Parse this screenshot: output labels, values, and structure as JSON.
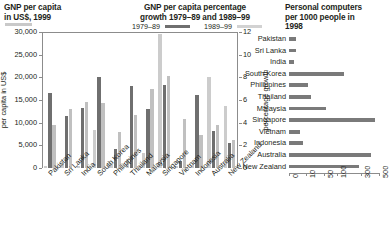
{
  "panels": {
    "left": {
      "title": "GNP per capita\nin US$, 1999",
      "title_line1": "GNP per capita",
      "title_line2": "in US$, 1999",
      "ylabel": "per capita in US$",
      "legend_swatch_color": "#c9c9c9"
    },
    "middle": {
      "title_line1": "GNP per capita percentage",
      "title_line2": "growth 1979–89 and 1989–99",
      "ylabel": "percentage growth",
      "legend": [
        {
          "label": "1979–89",
          "color": "#6f6f6f"
        },
        {
          "label": "1989–99",
          "color": "#d2d2d2"
        }
      ]
    },
    "right": {
      "title_line1": "Personal computers",
      "title_line2": "per 1000 people in",
      "title_line3": "1998"
    }
  },
  "chart_data": [
    {
      "type": "bar",
      "title": "GNP per capita in US$, 1999",
      "xlabel": "",
      "ylabel": "per capita in US$",
      "ylim": [
        0,
        30000
      ],
      "yticks": [
        0,
        5000,
        10000,
        15000,
        20000,
        25000,
        30000
      ],
      "ytick_labels": [
        "0",
        "5,000",
        "10,000",
        "15,000",
        "20,000",
        "25,000",
        "30,000"
      ],
      "grid": false,
      "legend_position": "above-left",
      "categories": [
        "Pakistan",
        "Sri Lanka",
        "India",
        "South Korea",
        "Philippines",
        "Thailand",
        "Malaysia",
        "Singapore",
        "Vietnam",
        "Indonesia",
        "Australia",
        "New Zealand"
      ],
      "series": [
        {
          "name": "GNP per capita in US$, 1999",
          "color": "#cccccc",
          "values": [
            440,
            820,
            450,
            8490,
            1020,
            1960,
            3390,
            29610,
            370,
            580,
            20050,
            13780
          ]
        }
      ]
    },
    {
      "type": "bar",
      "title": "GNP per capita percentage growth 1979–89 and 1989–99",
      "xlabel": "",
      "ylabel": "percentage growth",
      "ylim": [
        0,
        12
      ],
      "yticks": [
        0,
        2,
        4,
        6,
        8,
        10,
        12
      ],
      "ytick_labels": [
        "0",
        "2",
        "4",
        "6",
        "8",
        "10",
        "12"
      ],
      "grid": false,
      "legend_position": "above-center",
      "categories": [
        "Pakistan",
        "Sri Lanka",
        "India",
        "South Korea",
        "Philippines",
        "Thailand",
        "Malaysia",
        "Singapore",
        "Vietnam",
        "Indonesia",
        "Australia",
        "New Zealand"
      ],
      "series": [
        {
          "name": "1979–89",
          "color": "#6f6f6f",
          "values": [
            6.6,
            4.6,
            5.3,
            8.0,
            1.7,
            7.2,
            5.2,
            7.3,
            0.6,
            6.4,
            3.3,
            2.2
          ]
        },
        {
          "name": "1989–99",
          "color": "#c0c0c0",
          "values": [
            3.8,
            5.2,
            5.8,
            5.7,
            3.2,
            4.7,
            7.0,
            8.1,
            4.3,
            2.9,
            3.8,
            2.5
          ]
        }
      ]
    },
    {
      "type": "bar",
      "orientation": "horizontal",
      "title": "Personal computers per 1000 people in 1998",
      "xlabel": "",
      "ylabel": "",
      "xscale": "log",
      "xlim": [
        0,
        500
      ],
      "xticks": [
        0,
        10,
        50,
        100,
        300,
        500
      ],
      "xtick_labels": [
        "0",
        "10",
        "50",
        "100",
        "300",
        "500"
      ],
      "grid": false,
      "bar_color": "#7a7a7a",
      "categories": [
        "Pakistan",
        "Sri Lanka",
        "India",
        "South Korea",
        "Philippines",
        "Thailand",
        "Malaysia",
        "Singapore",
        "Vietnam",
        "Indonesia",
        "Australia",
        "New Zealand"
      ],
      "values": [
        3.9,
        4.1,
        2.7,
        156.8,
        15.1,
        21.6,
        58.6,
        458.4,
        6.4,
        8.2,
        411.8,
        282.3
      ]
    }
  ]
}
